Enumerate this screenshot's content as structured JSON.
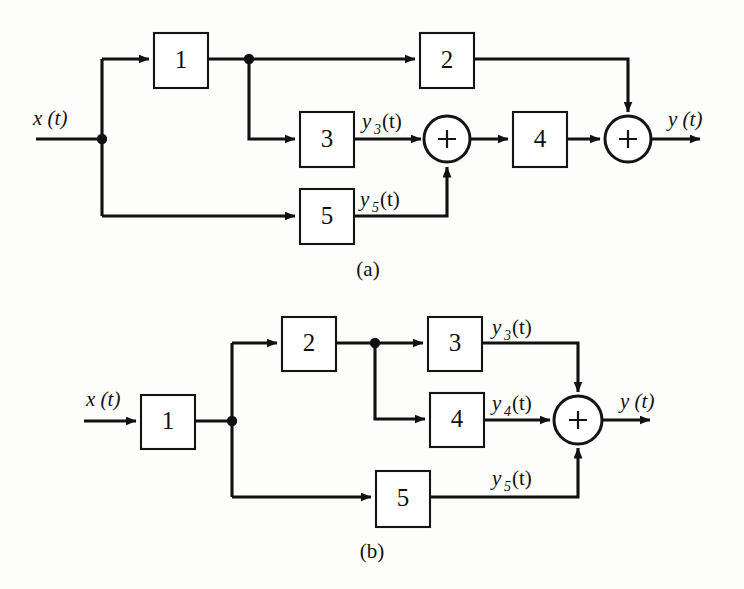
{
  "figure": {
    "type": "block-diagram",
    "background_color": "#fdfdfc",
    "line_color": "#111111",
    "panels": [
      {
        "id": "a",
        "caption": "(a)",
        "input_label": "x (t)",
        "output_label": "y (t)",
        "blocks": [
          {
            "id": "a1",
            "label": "1"
          },
          {
            "id": "a2",
            "label": "2"
          },
          {
            "id": "a3",
            "label": "3"
          },
          {
            "id": "a4",
            "label": "4"
          },
          {
            "id": "a5",
            "label": "5"
          }
        ],
        "summers": [
          {
            "id": "a-sum1",
            "label": "+"
          },
          {
            "id": "a-sum2",
            "label": "+"
          }
        ],
        "signal_labels": [
          {
            "id": "a-y3",
            "base": "y",
            "sub": "3",
            "arg": "(t)"
          },
          {
            "id": "a-y5",
            "base": "y",
            "sub": "5",
            "arg": "(t)"
          }
        ]
      },
      {
        "id": "b",
        "caption": "(b)",
        "input_label": "x (t)",
        "output_label": "y (t)",
        "blocks": [
          {
            "id": "b1",
            "label": "1"
          },
          {
            "id": "b2",
            "label": "2"
          },
          {
            "id": "b3",
            "label": "3"
          },
          {
            "id": "b4",
            "label": "4"
          },
          {
            "id": "b5",
            "label": "5"
          }
        ],
        "summers": [
          {
            "id": "b-sum1",
            "label": "+"
          }
        ],
        "signal_labels": [
          {
            "id": "b-y3",
            "base": "y",
            "sub": "3",
            "arg": "(t)"
          },
          {
            "id": "b-y4",
            "base": "y",
            "sub": "4",
            "arg": "(t)"
          },
          {
            "id": "b-y5",
            "base": "y",
            "sub": "5",
            "arg": "(t)"
          }
        ]
      }
    ]
  }
}
